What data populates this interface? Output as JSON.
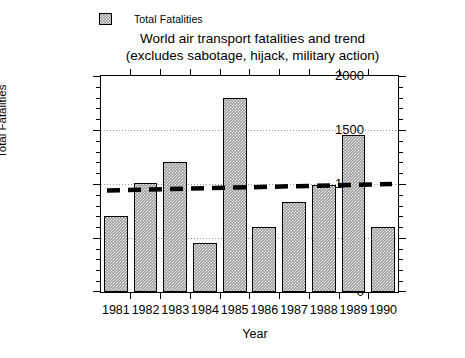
{
  "chart_data": {
    "type": "bar",
    "title": "World air transport fatalities and trend",
    "subtitle": "(excludes sabotage, hijack, military action)",
    "xlabel": "Year",
    "ylabel": "Total Fatalities",
    "categories": [
      "1981",
      "1982",
      "1983",
      "1984",
      "1985",
      "1986",
      "1987",
      "1988",
      "1989",
      "1990"
    ],
    "values": [
      700,
      1010,
      1200,
      450,
      1800,
      600,
      830,
      990,
      1450,
      605
    ],
    "series": [
      {
        "name": "Total Fatalities",
        "type": "bar",
        "values": [
          700,
          1010,
          1200,
          450,
          1800,
          600,
          830,
          990,
          1450,
          605
        ]
      },
      {
        "name": "trend",
        "type": "line",
        "style": "dashed",
        "color": "#000000",
        "start_value": 940,
        "end_value": 1000,
        "values": [
          940,
          947,
          953,
          960,
          967,
          973,
          980,
          987,
          993,
          1000
        ]
      }
    ],
    "ylim": [
      0,
      2000
    ],
    "yticks": [
      0,
      500,
      1000,
      1500,
      2000
    ],
    "ytick_labels": [
      "0",
      "500",
      "1000",
      "1500",
      "2000"
    ],
    "yminor_step": 100,
    "grid": "horizontal-dotted-at-500-1000-1500",
    "gridlines": [
      500,
      1000,
      1500
    ],
    "legend": {
      "position": "top-left",
      "entries": [
        {
          "label": "Total Fatalities",
          "swatch": "hatched-gray"
        }
      ]
    },
    "bar_fill_color": "#9a9a9a",
    "bar_edge_color": "#000000",
    "background": "#ffffff"
  },
  "legend": {
    "entry_label": "Total Fatalities",
    "swatch_name": "legend-swatch-total-fatalities"
  },
  "title": {
    "line1": "World air transport fatalities and trend",
    "line2": "(excludes sabotage, hijack, military action)"
  },
  "axes": {
    "y_title": "Total Fatalities",
    "x_title": "Year"
  }
}
